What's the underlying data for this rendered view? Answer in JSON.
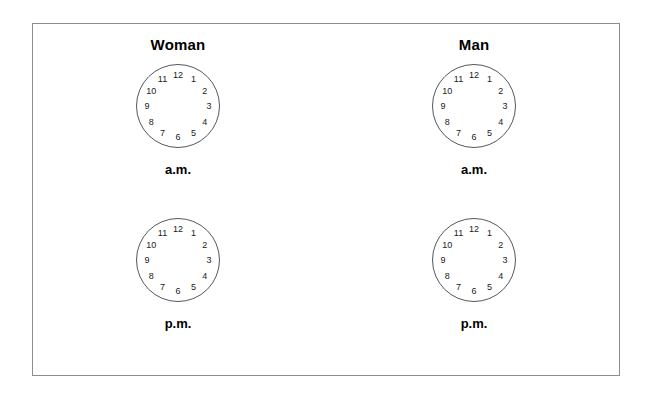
{
  "figure": {
    "border_color": "#8c8c8c",
    "background": "#ffffff"
  },
  "columns": [
    {
      "header": "Woman"
    },
    {
      "header": "Man"
    }
  ],
  "rows": [
    {
      "label": "a.m."
    },
    {
      "label": "p.m."
    }
  ],
  "clock": {
    "has_hands": false,
    "numerals": [
      "12",
      "1",
      "2",
      "3",
      "4",
      "5",
      "6",
      "7",
      "8",
      "9",
      "10",
      "11"
    ],
    "stroke_color": "#55575a",
    "numeral_color": "#1a1a1a"
  },
  "clocks": [
    {
      "column": "Woman",
      "period": "a.m.",
      "numerals": [
        "12",
        "1",
        "2",
        "3",
        "4",
        "5",
        "6",
        "7",
        "8",
        "9",
        "10",
        "11"
      ]
    },
    {
      "column": "Man",
      "period": "a.m.",
      "numerals": [
        "12",
        "1",
        "2",
        "3",
        "4",
        "5",
        "6",
        "7",
        "8",
        "9",
        "10",
        "11"
      ]
    },
    {
      "column": "Woman",
      "period": "p.m.",
      "numerals": [
        "12",
        "1",
        "2",
        "3",
        "4",
        "5",
        "6",
        "7",
        "8",
        "9",
        "10",
        "11"
      ]
    },
    {
      "column": "Man",
      "period": "p.m.",
      "numerals": [
        "12",
        "1",
        "2",
        "3",
        "4",
        "5",
        "6",
        "7",
        "8",
        "9",
        "10",
        "11"
      ]
    }
  ]
}
